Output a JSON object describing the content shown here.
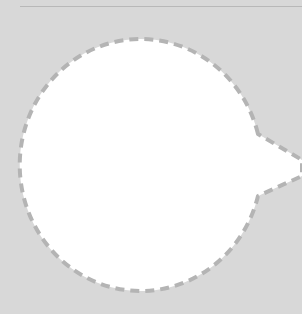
{
  "canvas": {
    "background": "#d8d8d8",
    "rule_color": "#b8b8b8"
  },
  "bubble": {
    "fill": "#ffffff",
    "stroke": "#b4b4b4",
    "dash": "9 6",
    "pointer_direction": "right"
  }
}
